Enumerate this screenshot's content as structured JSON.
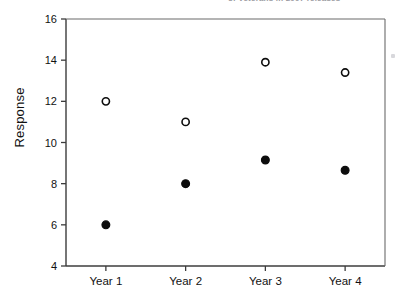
{
  "header": {
    "cut_off_text": "of Veterans in 2007 releases"
  },
  "chart_data": {
    "type": "scatter",
    "title": "",
    "xlabel": "",
    "ylabel": "Response",
    "categories": [
      "Year 1",
      "Year 2",
      "Year 3",
      "Year 4"
    ],
    "ylim": [
      4,
      16
    ],
    "yticks": [
      4,
      6,
      8,
      10,
      12,
      14,
      16
    ],
    "ytick_labels": [
      "4",
      "6",
      "8",
      "10",
      "12",
      "14",
      "16"
    ],
    "grid": false,
    "legend": "none",
    "series": [
      {
        "name": "open-circle-series",
        "marker": "open-circle",
        "color": "#0d0d0d",
        "values": [
          12.0,
          11.0,
          13.9,
          13.4
        ]
      },
      {
        "name": "filled-circle-series",
        "marker": "filled-circle",
        "color": "#0d0d0d",
        "values": [
          6.0,
          8.0,
          9.15,
          8.65
        ]
      }
    ]
  },
  "colors": {
    "marker_stroke": "#0d0d0d",
    "axis": "#3c3c3c",
    "frame": "#6b6b6b",
    "background": "#ffffff"
  }
}
